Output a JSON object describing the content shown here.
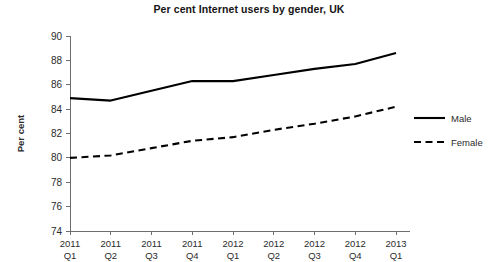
{
  "chart_data": {
    "type": "line",
    "title": "Per cent Internet users by gender, UK",
    "xlabel": "",
    "ylabel": "Per cent",
    "categories": [
      "2011 Q1",
      "2011 Q2",
      "2011 Q3",
      "2011 Q4",
      "2012 Q1",
      "2012 Q2",
      "2012 Q3",
      "2012 Q4",
      "2013 Q1"
    ],
    "category_lines": [
      [
        "2011",
        "Q1"
      ],
      [
        "2011",
        "Q2"
      ],
      [
        "2011",
        "Q3"
      ],
      [
        "2011",
        "Q4"
      ],
      [
        "2012",
        "Q1"
      ],
      [
        "2012",
        "Q2"
      ],
      [
        "2012",
        "Q3"
      ],
      [
        "2012",
        "Q4"
      ],
      [
        "2013",
        "Q1"
      ]
    ],
    "series": [
      {
        "name": "Male",
        "style": "solid",
        "color": "#000000",
        "values": [
          84.9,
          84.7,
          85.5,
          86.3,
          86.3,
          86.8,
          87.3,
          87.7,
          88.6
        ]
      },
      {
        "name": "Female",
        "style": "dashed",
        "color": "#000000",
        "values": [
          80.0,
          80.2,
          80.8,
          81.4,
          81.7,
          82.3,
          82.8,
          83.4,
          84.2
        ]
      }
    ],
    "ylim": [
      74,
      90
    ],
    "ytick_step": 2,
    "ytick_labels": [
      "74",
      "76",
      "78",
      "80",
      "82",
      "84",
      "86",
      "88",
      "90"
    ],
    "grid": false,
    "legend_position": "right"
  },
  "legend": {
    "entries": [
      {
        "label": "Male",
        "style": "solid"
      },
      {
        "label": "Female",
        "style": "dashed"
      }
    ]
  }
}
